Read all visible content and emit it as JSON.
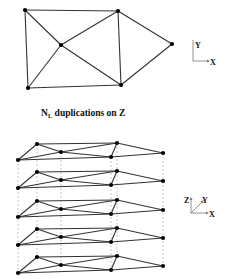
{
  "caption": {
    "main": "N",
    "sub": "L",
    "rest": " duplications on Z"
  },
  "axes2d": {
    "x_label": "X",
    "y_label": "Y"
  },
  "axes3d": {
    "x_label": "X",
    "y_label": "Y",
    "z_label": "Z"
  },
  "graph2d": {
    "nodes": [
      {
        "id": "A",
        "x": 25,
        "y": 10
      },
      {
        "id": "B",
        "x": 28,
        "y": 88
      },
      {
        "id": "C",
        "x": 61,
        "y": 45
      },
      {
        "id": "D",
        "x": 118,
        "y": 11
      },
      {
        "id": "E",
        "x": 121,
        "y": 85
      },
      {
        "id": "F",
        "x": 172,
        "y": 44
      }
    ],
    "edges": [
      [
        "A",
        "D"
      ],
      [
        "A",
        "B"
      ],
      [
        "A",
        "C"
      ],
      [
        "C",
        "D"
      ],
      [
        "C",
        "E"
      ],
      [
        "B",
        "C"
      ],
      [
        "B",
        "E"
      ],
      [
        "D",
        "E"
      ],
      [
        "D",
        "F"
      ],
      [
        "E",
        "F"
      ]
    ]
  },
  "graph3d": {
    "layer_count": 5,
    "layer_offsets": [
      0,
      28,
      57,
      85,
      113
    ],
    "nodes": [
      {
        "id": "A",
        "x": 37,
        "y": 144
      },
      {
        "id": "B",
        "x": 18,
        "y": 160
      },
      {
        "id": "C",
        "x": 61,
        "y": 152
      },
      {
        "id": "D",
        "x": 117,
        "y": 143
      },
      {
        "id": "E",
        "x": 111,
        "y": 157
      },
      {
        "id": "F",
        "x": 163,
        "y": 153
      }
    ],
    "edges": [
      [
        "A",
        "D"
      ],
      [
        "A",
        "B"
      ],
      [
        "A",
        "C"
      ],
      [
        "C",
        "D"
      ],
      [
        "C",
        "E"
      ],
      [
        "B",
        "C"
      ],
      [
        "B",
        "E"
      ],
      [
        "D",
        "E"
      ],
      [
        "D",
        "F"
      ],
      [
        "E",
        "F"
      ]
    ]
  }
}
